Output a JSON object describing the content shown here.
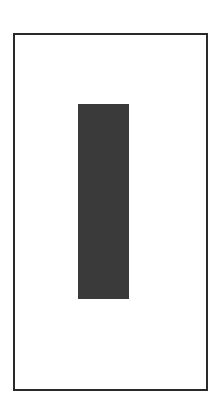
{
  "canvas": {
    "width": 218,
    "height": 410,
    "background": "#ffffff"
  },
  "frame": {
    "border_color": "#2a2a2a"
  },
  "shape": {
    "type": "rectangle",
    "fill": "#3a3a3a"
  }
}
